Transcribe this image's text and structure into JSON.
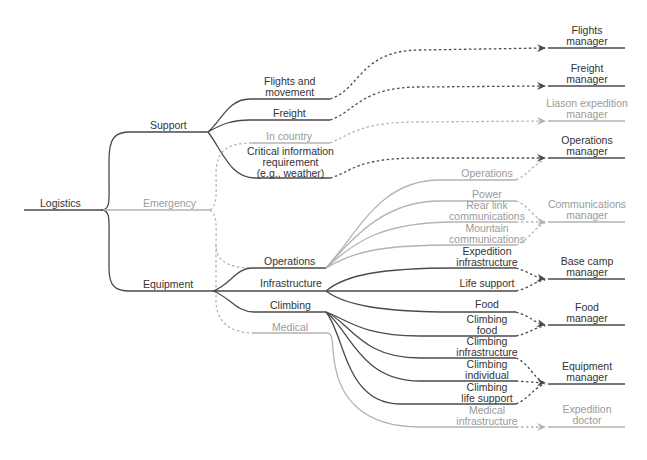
{
  "colors": {
    "dark": "#4a4a4a",
    "gray": "#b3b3b3",
    "text_dark": "#333333",
    "text_gray": "#9a9a9a",
    "background": "#ffffff"
  },
  "diagram": {
    "root": {
      "label": "Logistics"
    },
    "level1": [
      {
        "id": "support",
        "label": "Support",
        "style": "dark"
      },
      {
        "id": "emergency",
        "label": "Emergency",
        "style": "gray"
      },
      {
        "id": "equipment",
        "label": "Equipment",
        "style": "dark"
      }
    ],
    "support_children": [
      {
        "id": "flights",
        "label_lines": [
          "Flights and",
          "movement"
        ],
        "style": "dark"
      },
      {
        "id": "freight",
        "label_lines": [
          "Freight"
        ],
        "style": "dark"
      },
      {
        "id": "in_country",
        "label_lines": [
          "In country"
        ],
        "style": "gray"
      },
      {
        "id": "critical",
        "label_lines": [
          "Critical information",
          "requirement",
          "(e.g., weather)"
        ],
        "style": "dark"
      }
    ],
    "equipment_children": [
      {
        "id": "operations",
        "label": "Operations",
        "style": "dark"
      },
      {
        "id": "infrastructure",
        "label": "Infrastructure",
        "style": "dark"
      },
      {
        "id": "climbing",
        "label": "Climbing",
        "style": "dark"
      },
      {
        "id": "medical",
        "label": "Medical",
        "style": "gray"
      }
    ],
    "leaves": [
      {
        "id": "ops_leaf",
        "label_lines": [
          "Operations"
        ],
        "style": "gray"
      },
      {
        "id": "power",
        "label_lines": [
          "Power"
        ],
        "style": "gray"
      },
      {
        "id": "rear_link",
        "label_lines": [
          "Rear link",
          "communications"
        ],
        "style": "gray"
      },
      {
        "id": "mountain",
        "label_lines": [
          "Mountain",
          "communications"
        ],
        "style": "gray"
      },
      {
        "id": "exp_infra",
        "label_lines": [
          "Expedition",
          "infrastructure"
        ],
        "style": "dark"
      },
      {
        "id": "life_support",
        "label_lines": [
          "Life support"
        ],
        "style": "dark"
      },
      {
        "id": "food",
        "label_lines": [
          "Food"
        ],
        "style": "dark"
      },
      {
        "id": "climbing_food",
        "label_lines": [
          "Climbing",
          "food"
        ],
        "style": "dark"
      },
      {
        "id": "climbing_infra",
        "label_lines": [
          "Climbing",
          "infrastructure"
        ],
        "style": "dark"
      },
      {
        "id": "climbing_individual",
        "label_lines": [
          "Climbing",
          "individual"
        ],
        "style": "dark"
      },
      {
        "id": "climbing_life",
        "label_lines": [
          "Climbing",
          "life support"
        ],
        "style": "dark"
      },
      {
        "id": "medical_infra",
        "label_lines": [
          "Medical",
          "infrastructure"
        ],
        "style": "gray"
      }
    ],
    "managers": [
      {
        "id": "flights_mgr",
        "label_lines": [
          "Flights",
          "manager"
        ],
        "style": "dark"
      },
      {
        "id": "freight_mgr",
        "label_lines": [
          "Freight",
          "manager"
        ],
        "style": "dark"
      },
      {
        "id": "liason_mgr",
        "label_lines": [
          "Liason expedition",
          "manager"
        ],
        "style": "gray"
      },
      {
        "id": "operations_mgr",
        "label_lines": [
          "Operations",
          "manager"
        ],
        "style": "dark"
      },
      {
        "id": "comms_mgr",
        "label_lines": [
          "Communications",
          "manager"
        ],
        "style": "gray"
      },
      {
        "id": "basecamp_mgr",
        "label_lines": [
          "Base camp",
          "manager"
        ],
        "style": "dark"
      },
      {
        "id": "food_mgr",
        "label_lines": [
          "Food",
          "manager"
        ],
        "style": "dark"
      },
      {
        "id": "equipment_mgr",
        "label_lines": [
          "Equipment",
          "manager"
        ],
        "style": "dark"
      },
      {
        "id": "doctor",
        "label_lines": [
          "Expedition",
          "doctor"
        ],
        "style": "gray"
      }
    ]
  }
}
